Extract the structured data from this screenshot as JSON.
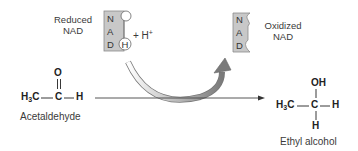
{
  "reduced_nad": {
    "label_line1": "Reduced",
    "label_line2": "NAD",
    "letters": [
      "N",
      "A",
      "D"
    ],
    "hydrogen": "H",
    "plus_text": "+ H",
    "plus_sup": "+"
  },
  "oxidized_nad": {
    "label_line1": "Oxidized",
    "label_line2": "NAD",
    "letters": [
      "N",
      "A",
      "D"
    ]
  },
  "acetaldehyde": {
    "oxygen": "O",
    "left": "H",
    "left_sub": "3",
    "left_c": "C",
    "carbon": "C",
    "right_h": "H",
    "name": "Acetaldehyde"
  },
  "ethyl_alcohol": {
    "oh": "OH",
    "left": "H",
    "left_sub": "3",
    "left_c": "C",
    "carbon": "C",
    "right_h": "H",
    "bottom_h": "H",
    "name": "Ethyl alcohol"
  },
  "colors": {
    "nad_box_fill": "#c8c8c8",
    "nad_box_stroke": "#8a8a8a",
    "arrow_gray": "#888888"
  }
}
